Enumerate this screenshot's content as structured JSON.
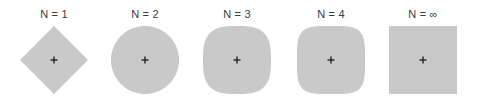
{
  "figure": {
    "colors": {
      "fill": "#c9c9c9",
      "marker": "#1a1a1a",
      "label": "#3a3a3a"
    },
    "panels": [
      {
        "label": "N = 1",
        "exponent": 1,
        "shape": "diamond",
        "center_x": 54,
        "center_y": 60,
        "half_size": 34
      },
      {
        "label": "N = 2",
        "exponent": 2,
        "shape": "circle",
        "center_x": 145,
        "center_y": 60,
        "half_size": 34
      },
      {
        "label": "N = 3",
        "exponent": 3,
        "shape": "superellipse",
        "center_x": 237,
        "center_y": 60,
        "half_size": 34
      },
      {
        "label": "N = 4",
        "exponent": 4,
        "shape": "superellipse",
        "center_x": 331,
        "center_y": 60,
        "half_size": 34
      },
      {
        "label": "N = ∞",
        "exponent": "infinity",
        "shape": "square",
        "center_x": 423,
        "center_y": 60,
        "half_size": 34
      }
    ],
    "center_marker": "+"
  }
}
